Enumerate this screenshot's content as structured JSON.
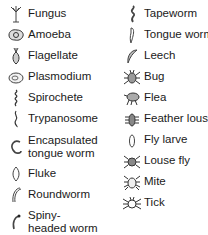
{
  "legend": {
    "left": [
      {
        "label": "Fungus",
        "icon": "fungus-icon"
      },
      {
        "label": "Amoeba",
        "icon": "amoeba-icon"
      },
      {
        "label": "Flagellate",
        "icon": "flagellate-icon"
      },
      {
        "label": "Plasmodium",
        "icon": "plasmodium-icon"
      },
      {
        "label": "Spirochete",
        "icon": "spirochete-icon"
      },
      {
        "label": "Trypanosome",
        "icon": "trypanosome-icon"
      },
      {
        "label": "Encapsulated tongue worm",
        "icon": "encapsulated-tongue-worm-icon"
      },
      {
        "label": "Fluke",
        "icon": "fluke-icon"
      },
      {
        "label": "Roundworm",
        "icon": "roundworm-icon"
      },
      {
        "label": "Spiny-headed worm",
        "icon": "spiny-headed-worm-icon"
      }
    ],
    "right": [
      {
        "label": "Tapeworm",
        "icon": "tapeworm-icon"
      },
      {
        "label": "Tongue worm",
        "icon": "tongue-worm-icon"
      },
      {
        "label": "Leech",
        "icon": "leech-icon"
      },
      {
        "label": "Bug",
        "icon": "bug-icon"
      },
      {
        "label": "Flea",
        "icon": "flea-icon"
      },
      {
        "label": "Feather louse",
        "icon": "feather-louse-icon"
      },
      {
        "label": "Fly larve",
        "icon": "fly-larve-icon"
      },
      {
        "label": "Louse fly",
        "icon": "louse-fly-icon"
      },
      {
        "label": "Mite",
        "icon": "mite-icon"
      },
      {
        "label": "Tick",
        "icon": "tick-icon"
      }
    ]
  }
}
